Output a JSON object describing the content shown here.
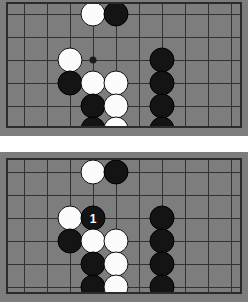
{
  "figure": {
    "background_color": "#ffffff",
    "board_color": "#7d7d7d",
    "line_color": "#32322f",
    "black_color": "#141414",
    "white_color": "#fbfbfb"
  },
  "boards": [
    {
      "id": "board-top",
      "label": "Top diagram",
      "cols": 10,
      "rows": 6,
      "hoshi": [
        {
          "col": 3,
          "row": 2
        }
      ],
      "stones": [
        {
          "col": 3,
          "row": 0,
          "color": "white",
          "label": ""
        },
        {
          "col": 4,
          "row": 0,
          "color": "black",
          "label": ""
        },
        {
          "col": 2,
          "row": 2,
          "color": "white",
          "label": ""
        },
        {
          "col": 6,
          "row": 2,
          "color": "black",
          "label": ""
        },
        {
          "col": 2,
          "row": 3,
          "color": "black",
          "label": ""
        },
        {
          "col": 3,
          "row": 3,
          "color": "white",
          "label": ""
        },
        {
          "col": 4,
          "row": 3,
          "color": "white",
          "label": ""
        },
        {
          "col": 6,
          "row": 3,
          "color": "black",
          "label": ""
        },
        {
          "col": 3,
          "row": 4,
          "color": "black",
          "label": ""
        },
        {
          "col": 4,
          "row": 4,
          "color": "white",
          "label": ""
        },
        {
          "col": 6,
          "row": 4,
          "color": "black",
          "label": ""
        },
        {
          "col": 3,
          "row": 5,
          "color": "black",
          "label": ""
        },
        {
          "col": 4,
          "row": 5,
          "color": "white",
          "label": ""
        },
        {
          "col": 6,
          "row": 5,
          "color": "black",
          "label": ""
        }
      ]
    },
    {
      "id": "board-bot",
      "label": "Bottom diagram",
      "cols": 10,
      "rows": 6,
      "hoshi": [],
      "stones": [
        {
          "col": 3,
          "row": 0,
          "color": "white",
          "label": ""
        },
        {
          "col": 4,
          "row": 0,
          "color": "black",
          "label": ""
        },
        {
          "col": 2,
          "row": 2,
          "color": "white",
          "label": ""
        },
        {
          "col": 3,
          "row": 2,
          "color": "black",
          "label": "1"
        },
        {
          "col": 6,
          "row": 2,
          "color": "black",
          "label": ""
        },
        {
          "col": 2,
          "row": 3,
          "color": "black",
          "label": ""
        },
        {
          "col": 3,
          "row": 3,
          "color": "white",
          "label": ""
        },
        {
          "col": 4,
          "row": 3,
          "color": "white",
          "label": ""
        },
        {
          "col": 6,
          "row": 3,
          "color": "black",
          "label": ""
        },
        {
          "col": 3,
          "row": 4,
          "color": "black",
          "label": ""
        },
        {
          "col": 4,
          "row": 4,
          "color": "white",
          "label": ""
        },
        {
          "col": 6,
          "row": 4,
          "color": "black",
          "label": ""
        },
        {
          "col": 3,
          "row": 5,
          "color": "black",
          "label": ""
        },
        {
          "col": 4,
          "row": 5,
          "color": "white",
          "label": ""
        },
        {
          "col": 6,
          "row": 5,
          "color": "black",
          "label": ""
        }
      ]
    }
  ]
}
